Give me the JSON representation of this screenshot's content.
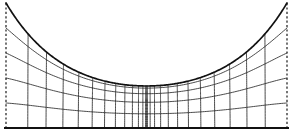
{
  "figure": {
    "title": "",
    "width": 293,
    "height": 135,
    "background_color": "#ffffff"
  },
  "colors": {
    "mesh_stroke": "#2b2b2b",
    "boundary_stroke": "#111111",
    "axis_stroke": "#111111",
    "dashed_stroke": "#1a1a1a",
    "background": "#ffffff"
  },
  "chart_data": {
    "type": "line",
    "title": "",
    "xlabel": "",
    "ylabel": "",
    "xlim": [
      0,
      293
    ],
    "ylim": [
      0,
      135
    ],
    "grid": true,
    "legend": null,
    "boundary_curve": {
      "name": "catenary-boundary",
      "x_left": 6,
      "x_right": 287,
      "y_top": 3,
      "y_bottom": 86,
      "samples_x": [
        6,
        20,
        34,
        48,
        62,
        76,
        90,
        104,
        118,
        132,
        146.5,
        161,
        175,
        189,
        203,
        217,
        231,
        245,
        259,
        273,
        287
      ],
      "samples_y": [
        3,
        18.2,
        31.6,
        43.3,
        53.4,
        62.0,
        69.1,
        74.9,
        79.3,
        82.5,
        84.6,
        82.5,
        79.3,
        74.9,
        69.1,
        62.0,
        53.4,
        43.3,
        31.6,
        18.2,
        3
      ]
    },
    "axis_bottom": {
      "name": "baseline",
      "x_start": 4,
      "x_end": 289,
      "y": 128
    },
    "dashed_edges": [
      {
        "name": "left-edge",
        "x": 6,
        "y_top": 3,
        "y_bottom": 128
      },
      {
        "name": "right-edge",
        "x": 287,
        "y_top": 3,
        "y_bottom": 128
      }
    ],
    "horizontal_mesh_curves": 4,
    "horizontal_mesh_levels": [
      0.2,
      0.4,
      0.6,
      0.8
    ],
    "vertical_mesh_lines": 25,
    "mesh_vertical_spacing_note": "Vertical lines cluster densely near the center where the boundary dips lowest",
    "mesh_horizontal_spacing_note": "Horizontal curves compress toward the boundary near the center"
  }
}
